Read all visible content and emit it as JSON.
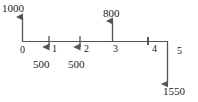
{
  "diagram": {
    "type": "cash-flow-timeline",
    "orientation": "horizontal",
    "line_color": "#555555",
    "text_color": "#1a1a1a",
    "background": "#ffffff",
    "axis": {
      "start_period": 0,
      "end_period": 5,
      "tick_labels": [
        "0",
        "1",
        "2",
        "3",
        "4",
        "5"
      ]
    },
    "period_labels": {
      "p0": "0",
      "p1": "1",
      "p2": "2",
      "p3": "3",
      "p4": "4",
      "p5": "5"
    },
    "amount_labels": {
      "inflow_t0": "1000",
      "outflow_t1": "500",
      "outflow_t2": "500",
      "inflow_t3": "800",
      "outflow_t5": "1550"
    },
    "cash_flows": [
      {
        "period": 0,
        "amount": 1000,
        "direction": "up",
        "label": "1000"
      },
      {
        "period": 1,
        "amount": 500,
        "direction": "down",
        "label": "500"
      },
      {
        "period": 2,
        "amount": 500,
        "direction": "down",
        "label": "500"
      },
      {
        "period": 3,
        "amount": 800,
        "direction": "up",
        "label": "800"
      },
      {
        "period": 4,
        "amount": 0,
        "direction": "none",
        "label": ""
      },
      {
        "period": 5,
        "amount": 1550,
        "direction": "down",
        "label": "1550"
      }
    ]
  }
}
